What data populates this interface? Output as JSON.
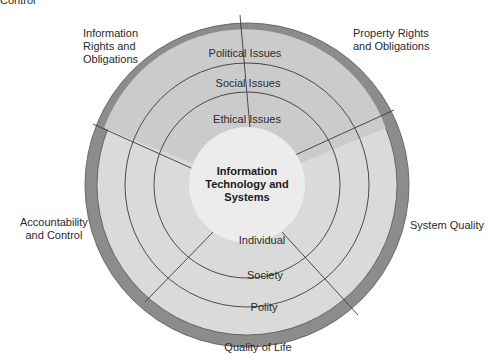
{
  "fragment_top_left": "Control",
  "center": {
    "line1": "Information",
    "line2": "Technology and",
    "line3": "Systems"
  },
  "rings_upper": {
    "outer": "Political Issues",
    "middle": "Social Issues",
    "inner": "Ethical Issues"
  },
  "rings_lower": {
    "inner": "Individual",
    "middle": "Society",
    "outer": "Polity"
  },
  "dimensions": {
    "info_rights": [
      "Information",
      "Rights and",
      "Obligations"
    ],
    "property_rights": [
      "Property Rights",
      "and Obligations"
    ],
    "system_quality": "System Quality",
    "quality_of_life": "Quality of Life",
    "accountability": [
      "Accountability",
      "and Control"
    ]
  },
  "colors": {
    "outer_ring": "#8c8c8c",
    "upper_fill": "#cfcfcf",
    "lower_fill": "#dcdcdc",
    "center_fill": "#ececec",
    "line": "#3a3a3a"
  }
}
